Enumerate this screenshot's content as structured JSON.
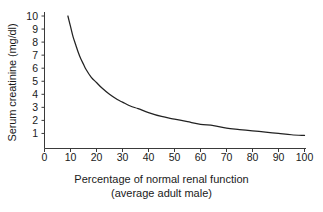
{
  "chart_data": {
    "type": "line",
    "title": "",
    "xlabel": "Percentage of normal renal function",
    "xlabel_line2": "(average adult male)",
    "ylabel": "Serum creatinine (mg/dl)",
    "xlim": [
      0,
      100
    ],
    "ylim": [
      0,
      10
    ],
    "xticks": [
      0,
      10,
      20,
      30,
      40,
      50,
      60,
      70,
      80,
      90,
      100
    ],
    "yticks": [
      1,
      2,
      3,
      4,
      5,
      6,
      7,
      8,
      9,
      10
    ],
    "xtick_labels": [
      "0",
      "10",
      "20",
      "30",
      "40",
      "50",
      "60",
      "70",
      "80",
      "90",
      "100"
    ],
    "ytick_labels": [
      "1",
      "2",
      "3",
      "4",
      "5",
      "6",
      "7",
      "8",
      "9",
      "10"
    ],
    "grid": false,
    "legend": null,
    "line_color": "#222222",
    "series": [
      {
        "name": "Serum creatinine vs renal function",
        "x": [
          9,
          10,
          11,
          12,
          13,
          14,
          15,
          16,
          18,
          20,
          22,
          25,
          28,
          30,
          33,
          36,
          40,
          45,
          50,
          55,
          60,
          65,
          70,
          75,
          80,
          85,
          90,
          95,
          100
        ],
        "y": [
          10.0,
          9.2,
          8.4,
          7.8,
          7.2,
          6.7,
          6.3,
          5.9,
          5.3,
          4.9,
          4.5,
          4.0,
          3.6,
          3.4,
          3.1,
          2.9,
          2.6,
          2.3,
          2.1,
          1.9,
          1.7,
          1.6,
          1.4,
          1.3,
          1.2,
          1.1,
          1.0,
          0.9,
          0.85
        ]
      }
    ]
  },
  "axes": {
    "y_title": "Serum creatinine (mg/dl)",
    "x_title_line1": "Percentage of normal renal function",
    "x_title_line2": "(average adult male)"
  },
  "colors": {
    "background": "#ffffff",
    "axis": "#3a3a3a",
    "curve": "#222222",
    "text": "#1a1a1a"
  }
}
